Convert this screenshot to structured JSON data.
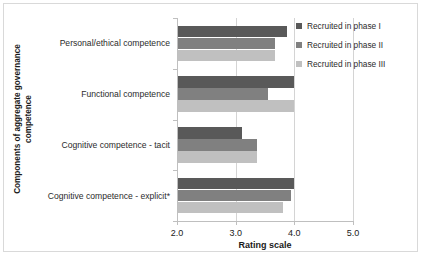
{
  "chart_data": {
    "type": "bar",
    "orientation": "horizontal",
    "title": "",
    "xlabel": "Rating scale",
    "ylabel": "Components of aggregate governance competence",
    "ylabel_lines": [
      "Components of aggregate governance",
      "competence"
    ],
    "categories": [
      "Personal/ethical competence",
      "Functional competence",
      "Cognitive competence - tacit",
      "Cognitive competence - explicit*"
    ],
    "series": [
      {
        "name": "Recruited in phase I",
        "color": "#595959",
        "values": [
          3.85,
          3.98,
          3.09,
          3.97
        ]
      },
      {
        "name": "Recruited in phase II",
        "color": "#808080",
        "values": [
          3.66,
          3.54,
          3.35,
          3.92
        ]
      },
      {
        "name": "Recruited in phase III",
        "color": "#c0c0c0",
        "values": [
          3.65,
          3.98,
          3.34,
          3.79
        ]
      }
    ],
    "xlim": [
      2.0,
      5.0
    ],
    "xticks": [
      "2.0",
      "3.0",
      "4.0",
      "5.0"
    ],
    "xtick_values": [
      2.0,
      3.0,
      4.0,
      5.0
    ],
    "grid": true,
    "legend_position": "top-right"
  },
  "legend": {
    "items": [
      {
        "label": "Recruited in phase I"
      },
      {
        "label": "Recruited in phase II"
      },
      {
        "label": "Recruited in phase III"
      }
    ]
  }
}
